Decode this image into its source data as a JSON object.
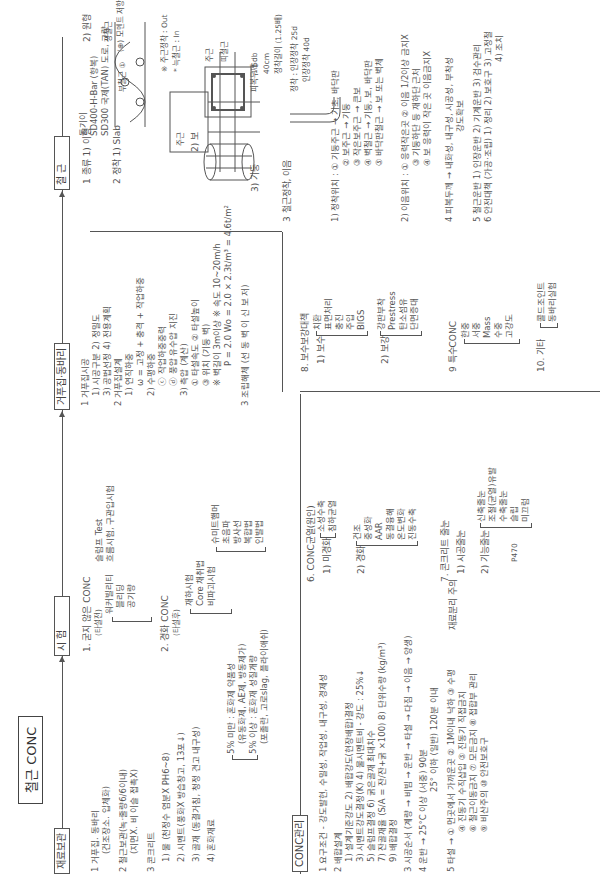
{
  "title": "철근 CONC",
  "flow": {
    "nodes": [
      "재료보관",
      "시 험",
      "거푸집·동바리",
      "철 근"
    ]
  },
  "storage": {
    "items": [
      "1 거푸집. 동바리",
      "(건조장소. 입체화)",
      "2 철근보관(녹·줄량6/6이내)",
      "(지면X. 비 이슬 접촉X)",
      "3 콘크리트",
      "1) 물 (천정수 염분X PH6~8)",
      "2) 시멘트(풍화X 방습창고, 13포↓)",
      "3) 골재 (동결거침, 청정 견고 내구성)",
      "4) 혼화재료"
    ],
    "admixture": [
      "5% 미만 : 혼화제 약품성",
      "(유동화제, AE제, 방동제가)",
      "5% 이상 : 혼화재 성질개량",
      "(포졸란, 고로slag, 플라이애쉬)"
    ]
  },
  "test": {
    "fresh": {
      "label": "1. 굳지 않은 CONC",
      "sub": "(타설전)",
      "items": [
        "워커빌리티",
        "블리딩",
        "공기량"
      ],
      "top": [
        "슬럼프 Test",
        "흐름시험, 구관입시험"
      ]
    },
    "hardened": {
      "label": "2. 경화 CONC",
      "sub": "(타설후)",
      "items": [
        "재하시험",
        "Core 채취법",
        "비파괴시험"
      ],
      "ndt": [
        "슈미트햄머",
        "초음파",
        "방사선",
        "복합법",
        "인발법"
      ]
    }
  },
  "formwork": {
    "items": [
      "1 거푸집시공",
      "1) 시공구분  2) 정밀도",
      "3) 공법선정  4) 전용계획",
      "2 거푸집설계",
      "1) 연직하중",
      "ω = 고정 + 충격 + 작업하중",
      "2) 수평하중",
      "ⓒ 작업하중중력",
      "ⓓ 풍압 유수압 지진",
      "3) 측압 (계산)",
      "① 타설속도  ② 타설높이",
      "③ 위치 (기둥 벽)",
      "※ 벽길이 3m이상 ※ 속도 10~20m/h",
      "P = 2.0 Wo = 2.0 × 2.3t/m³ = 4.6t/m²",
      "3 조립해체 (선 동 벽 이 신 보 저)"
    ]
  },
  "rebar": {
    "items": [
      "1 종류  1) 이형",
      "2 정착  1) Slab",
      "2) 보",
      "3) 기둥",
      "3 철근정착, 이음"
    ],
    "grades": [
      "SD400-H-Bar (항복)",
      "SD300 국제(TAN) 도로, 교량"
    ],
    "labels": [
      "돌기이",
      "2) 원형",
      "부철근 ①",
      "정철근",
      "(⊕) 모멘트 저항",
      "주근",
      "대근",
      "피복두께",
      "※ 주근정착 : Out",
      "* 늑철근 : In",
      "주근",
      "띠철근",
      "철근",
      "1.5db",
      "40cm",
      "정착길이 (1.25배)",
      "정착 : 인장정착 25d",
      "인장정착 40d",
      "4d",
      "공칭"
    ],
    "anchor_location": [
      "1) 정착위치 : ① 기둥주근 → 기초, 바닥판",
      "② 보주근 → 기둥",
      "③ 작은보주근 → 큰보",
      "④ 벽철근 → 기둥, 보, 바닥판",
      "⑤ 바닥판철근 → 보 또는 벽체"
    ],
    "splice_location": [
      "2) 이음위치 : ① 응력작은곳  ② 이음 1/2이상 금지X",
      "③ 기둥하단 등 재하단 근처",
      "④ 보 응력이 작은 곳 이음금지X"
    ],
    "extra": [
      "4 피복두께 → 내화성, 내구성, 시공성, 부착성",
      "강도확보",
      "5 철근운반  1) 인장운반  2) 기계운반  3) 검수관리",
      "6 안전대책 (가공·조립) 1) 정리  2) 보호구  3) 고정철",
      "4) 조치"
    ]
  },
  "conc_quality": {
    "header": "CONC관리",
    "items": [
      "1 요구조건 - 강도발현, 수밀성, 작업성, 내구성, 경제성",
      "2 배합설계",
      "1) 설계기준강도  2) 배합강도(현장배합)결정",
      "3) 시멘트강도결정(K)  4) 물시멘트비 - 강도 : 25%↓",
      "5) 슬럼프결정  6) 굵은골재 최대치수",
      "7) 잔골재율 (S/A = 잔/잔+굵 ×100)  8) 단위수량 (kg/m³)",
      "9) 배합결정",
      "3 시공순서 (계량 → 비빔 → 운반 → 타설 → 다짐 → 이음 → 양생)",
      "4 운반 → 25°C 이상 (서중) 90분",
      "25° 이하 (일반) 120분 이내",
      "5 타설 → ① 먼곳에서 가까운곳  ② 1M이내 낙하  ③ 수평",
      "④ 진동기 수직삽입  ⑤ 진동기 직접금지",
      "⑥ 철근이동금지  ⑦ 모든금지  ⑧ 접합부 관리",
      "⑨ 비산주의  ⑩ 안전보호구"
    ],
    "joint_label": "재료분리 주의"
  },
  "defects": {
    "s6": {
      "label": "6. CONC균열(원인)",
      "sub1": "1) 미경화",
      "sub1_items": [
        "소성수축",
        "침하균열"
      ],
      "sub2": "2) 경화",
      "sub2_items": [
        "건조",
        "중성화",
        "AAR",
        "동결융해",
        "온도변화",
        "진동수축"
      ]
    },
    "s7": {
      "label": "7. 콘크리트 줄눈",
      "sub1": "1) 시공줄눈",
      "sub2": "2) 기능줄눈",
      "sub2_items": [
        "신축줄눈",
        "조절(균열)유발",
        "수축줄눈",
        "슬립",
        "미끄럼"
      ],
      "note": "P470"
    },
    "s8": {
      "label": "8. 보수보강대책",
      "sub1": "1) 보수",
      "sub1_items": [
        "치환",
        "표면처리",
        "충진",
        "주입",
        "BIGS"
      ],
      "sub2": "2) 보강",
      "sub2_items": [
        "강판부착",
        "Prestress",
        "탄소섬유",
        "단면증대"
      ]
    },
    "s9": {
      "label": "9 특수CONC",
      "items": [
        "한중",
        "서중",
        "Mass",
        "수중",
        "고강도"
      ]
    },
    "s10": {
      "label": "10. 기타",
      "items": [
        "콜드조인트",
        "동바리실험"
      ]
    }
  }
}
